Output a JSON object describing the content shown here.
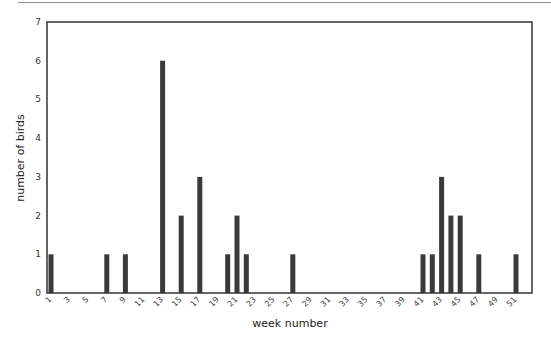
{
  "chart_data": {
    "type": "bar",
    "title": "",
    "xlabel": "week number",
    "ylabel": "number of birds",
    "ylim": [
      0,
      7
    ],
    "xlim": [
      1,
      52
    ],
    "grid": false,
    "legend": null,
    "yticks": [
      0,
      1,
      2,
      3,
      4,
      5,
      6,
      7
    ],
    "xticks": [
      1,
      3,
      5,
      7,
      9,
      11,
      13,
      15,
      17,
      19,
      21,
      23,
      25,
      27,
      29,
      31,
      33,
      35,
      37,
      39,
      41,
      43,
      45,
      47,
      49,
      51
    ],
    "x": [
      1,
      7,
      9,
      13,
      15,
      17,
      20,
      21,
      22,
      27,
      41,
      42,
      43,
      44,
      45,
      47,
      51
    ],
    "values": [
      1,
      1,
      1,
      6,
      2,
      3,
      1,
      2,
      1,
      1,
      1,
      1,
      3,
      2,
      2,
      1,
      1
    ],
    "bar_color": "#3a3a3a",
    "axis_color": "#333333"
  }
}
